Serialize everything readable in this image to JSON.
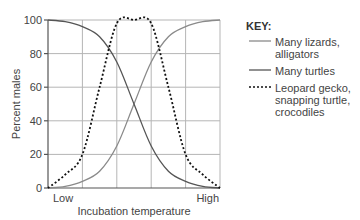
{
  "chart_data": {
    "type": "line",
    "title": "",
    "xlabel": "Incubation temperature",
    "ylabel": "Percent males",
    "x_tick_labels": [
      "Low",
      "High"
    ],
    "y_ticks": [
      0,
      20,
      40,
      60,
      80,
      100
    ],
    "ylim": [
      0,
      100
    ],
    "grid": true,
    "legend_position": "right",
    "legend_title": "KEY:",
    "x": [
      0,
      0.1,
      0.2,
      0.3,
      0.4,
      0.5,
      0.6,
      0.7,
      0.8,
      0.9,
      1.0
    ],
    "series": [
      {
        "name": "Many lizards, alligators",
        "style": "solid",
        "color": "#8a8a8a",
        "values": [
          0,
          1,
          4,
          10,
          25,
          50,
          75,
          90,
          96,
          99,
          100
        ]
      },
      {
        "name": "Many turtles",
        "style": "solid",
        "color": "#555555",
        "values": [
          100,
          99,
          96,
          90,
          75,
          50,
          25,
          10,
          4,
          1,
          0
        ]
      },
      {
        "name": "Leopard gecko, snapping turtle, crocodiles",
        "style": "dashed",
        "color": "#111111",
        "values": [
          0,
          8,
          20,
          60,
          98,
          100,
          98,
          60,
          20,
          8,
          0
        ]
      }
    ]
  },
  "axes": {
    "ylabel": "Percent males",
    "xlabel": "Incubation temperature",
    "x_low": "Low",
    "x_high": "High",
    "y_ticks": [
      "0",
      "20",
      "40",
      "60",
      "80",
      "100"
    ]
  },
  "key": {
    "title": "KEY:",
    "items": [
      {
        "label_line1": "Many lizards,",
        "label_line2": "alligators",
        "color": "#8a8a8a",
        "style": "solid"
      },
      {
        "label_line1": "Many turtles",
        "label_line2": "",
        "color": "#555555",
        "style": "solid"
      },
      {
        "label_line1": "Leopard gecko,",
        "label_line2": "snapping turtle,",
        "label_line3": "crocodiles",
        "color": "#111111",
        "style": "dashed"
      }
    ]
  }
}
